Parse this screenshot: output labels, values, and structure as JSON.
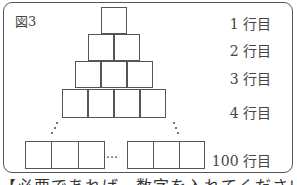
{
  "figure": {
    "label": "図3",
    "rows": [
      {
        "label": "1 行目",
        "boxes": 1
      },
      {
        "label": "2 行目",
        "boxes": 2
      },
      {
        "label": "3 行目",
        "boxes": 3
      },
      {
        "label": "4 行目",
        "boxes": 4
      },
      {
        "label": "100 行目",
        "boxes": 100
      }
    ],
    "ellipsis": "…"
  },
  "caption": "【必要であれば，数字を入れてください】"
}
